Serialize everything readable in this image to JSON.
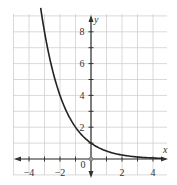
{
  "chart_data": {
    "type": "line",
    "title": "",
    "xlabel": "x",
    "ylabel": "y",
    "xlim": [
      -4.5,
      4.5
    ],
    "ylim": [
      -0.5,
      9
    ],
    "grid": true,
    "legend": null,
    "x_ticks": [
      -4,
      -2,
      0,
      2,
      4
    ],
    "x_tick_labels": [
      "−4",
      "−2",
      "0",
      "2",
      "4"
    ],
    "y_ticks": [
      2,
      4,
      6,
      8
    ],
    "y_tick_labels": [
      "2",
      "4",
      "6",
      "8"
    ],
    "series": [
      {
        "name": "y = (1/2)^x",
        "x": [
          -3,
          -2.5,
          -2,
          -1.5,
          -1,
          -0.5,
          0,
          0.5,
          1,
          1.5,
          2,
          2.5,
          3,
          3.5,
          4,
          4.5
        ],
        "y": [
          8,
          5.66,
          4,
          2.83,
          2,
          1.41,
          1,
          0.71,
          0.5,
          0.35,
          0.25,
          0.18,
          0.125,
          0.09,
          0.0625,
          0.044
        ]
      }
    ],
    "annotations": [
      "open circle at origin"
    ]
  },
  "colors": {
    "curve": "#222222",
    "grid": "#cfcfcf",
    "axis": "#333333"
  }
}
